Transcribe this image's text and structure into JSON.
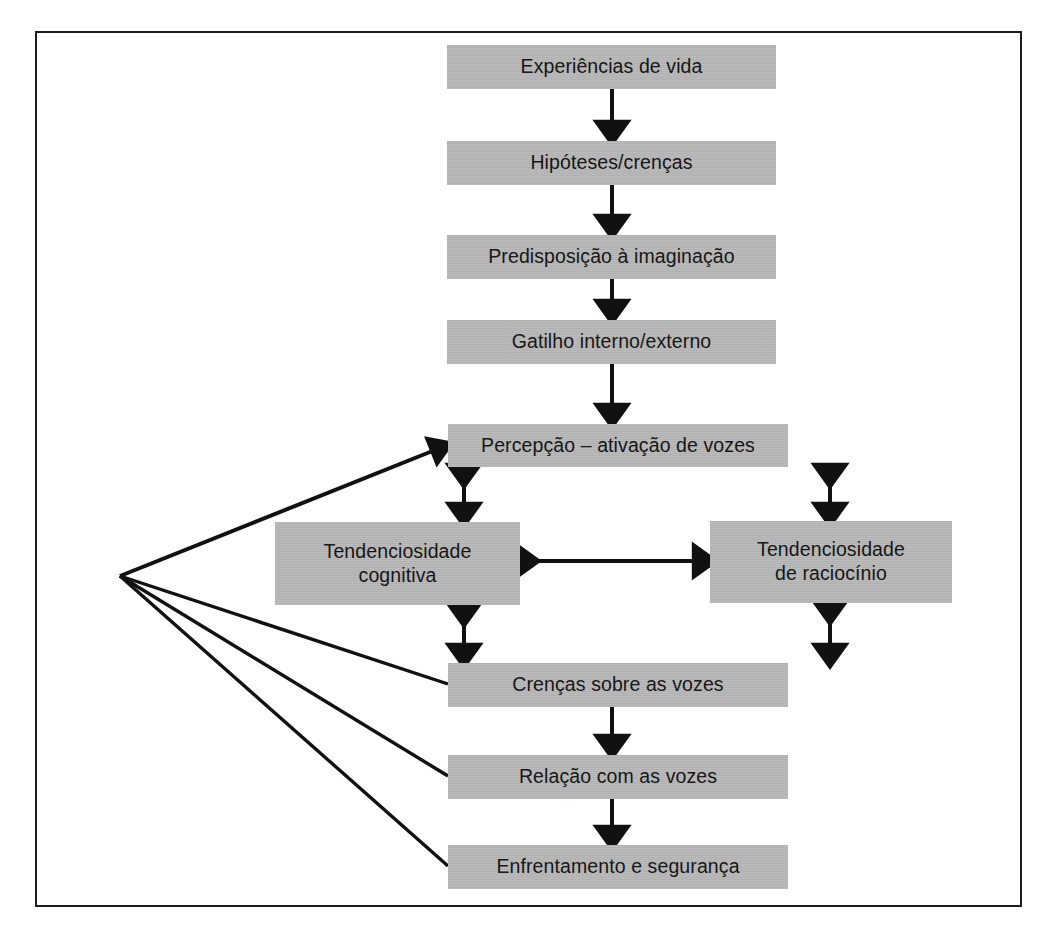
{
  "figure": {
    "kind": "flowchart",
    "language": "pt-BR",
    "background_color": "#ffffff",
    "frame_color": "#1c1c1c",
    "node_fill_color": "#b7b7b7",
    "node_text_color": "#111111",
    "connector_color": "#111111"
  },
  "nodes": [
    {
      "id": "experiencias",
      "label": "Experiências de vida"
    },
    {
      "id": "hipoteses",
      "label": "Hipóteses/crenças"
    },
    {
      "id": "predisposicao",
      "label": "Predisposição à imaginação"
    },
    {
      "id": "gatilho",
      "label": "Gatilho interno/externo"
    },
    {
      "id": "percepcao",
      "label": "Percepção – ativação de vozes"
    },
    {
      "id": "tend_cognitiva",
      "label": "Tendenciosidade\ncognitiva"
    },
    {
      "id": "tend_raciocinio",
      "label": "Tendenciosidade\nde raciocínio"
    },
    {
      "id": "crencas_vozes",
      "label": "Crenças sobre as vozes"
    },
    {
      "id": "relacao_vozes",
      "label": "Relação com as vozes"
    },
    {
      "id": "enfrentamento",
      "label": "Enfrentamento e segurança"
    }
  ],
  "edges": [
    {
      "from": "experiencias",
      "to": "hipoteses",
      "style": "single-arrow-down"
    },
    {
      "from": "hipoteses",
      "to": "predisposicao",
      "style": "single-arrow-down"
    },
    {
      "from": "predisposicao",
      "to": "gatilho",
      "style": "single-arrow-down"
    },
    {
      "from": "gatilho",
      "to": "percepcao",
      "style": "single-arrow-down"
    },
    {
      "from": "percepcao",
      "to": "tend_cognitiva",
      "style": "double-arrow-vertical"
    },
    {
      "from": "percepcao",
      "to": "tend_raciocinio",
      "style": "double-arrow-vertical"
    },
    {
      "from": "tend_cognitiva",
      "to": "tend_raciocinio",
      "style": "double-arrow-horizontal"
    },
    {
      "from": "tend_cognitiva",
      "to": "crencas_vozes",
      "style": "double-arrow-vertical"
    },
    {
      "from": "tend_raciocinio",
      "to": "crencas_vozes",
      "style": "double-arrow-vertical"
    },
    {
      "from": "crencas_vozes",
      "to": "relacao_vozes",
      "style": "single-arrow-down"
    },
    {
      "from": "relacao_vozes",
      "to": "enfrentamento",
      "style": "single-arrow-down"
    },
    {
      "from": "crencas_vozes",
      "to": "percepcao",
      "style": "feedback-line-to-hub"
    },
    {
      "from": "relacao_vozes",
      "to": "percepcao",
      "style": "feedback-line-to-hub"
    },
    {
      "from": "enfrentamento",
      "to": "percepcao",
      "style": "feedback-line-to-hub"
    },
    {
      "from": "hub",
      "to": "percepcao",
      "style": "feedback-arrow-from-hub"
    }
  ]
}
